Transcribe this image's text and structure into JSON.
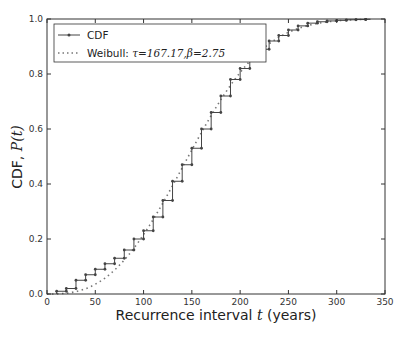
{
  "chart_data": {
    "type": "line",
    "title": "",
    "xlabel": "Recurrence interval t (years)",
    "ylabel": "CDF, P(t)",
    "xlim": [
      0,
      350
    ],
    "ylim": [
      0,
      1.0
    ],
    "xticks": [
      "0",
      "50",
      "100",
      "150",
      "200",
      "250",
      "300",
      "350"
    ],
    "yticks": [
      "0.0",
      "0.2",
      "0.4",
      "0.6",
      "0.8",
      "1.0"
    ],
    "grid": false,
    "legend_position": "upper left",
    "series": [
      {
        "name": "CDF",
        "style": "step with point markers",
        "x": [
          10,
          20,
          30,
          40,
          50,
          60,
          70,
          80,
          90,
          100,
          110,
          120,
          130,
          140,
          150,
          160,
          170,
          180,
          190,
          200,
          210,
          220,
          230,
          240,
          250,
          260,
          270,
          280,
          290,
          300,
          310,
          320,
          330
        ],
        "y": [
          0.01,
          0.02,
          0.05,
          0.07,
          0.09,
          0.11,
          0.13,
          0.16,
          0.2,
          0.23,
          0.28,
          0.34,
          0.41,
          0.47,
          0.53,
          0.6,
          0.66,
          0.72,
          0.78,
          0.82,
          0.86,
          0.89,
          0.92,
          0.94,
          0.96,
          0.975,
          0.985,
          0.99,
          0.993,
          0.995,
          0.997,
          0.998,
          0.999
        ]
      },
      {
        "name": "Weibull: τ=167.17, β=2.75",
        "style": "dotted",
        "params": {
          "tau": 167.17,
          "beta": 2.75
        }
      }
    ]
  },
  "legend": {
    "cdf": "CDF",
    "weibull_prefix": "Weibull: ",
    "weibull_math": "τ=167.17,β=2.75"
  },
  "axes": {
    "xlabel_pre": "Recurrence interval ",
    "xlabel_var": "t",
    "xlabel_post": " (years)",
    "ylabel_pre": "CDF, ",
    "ylabel_var": "P(t)"
  }
}
